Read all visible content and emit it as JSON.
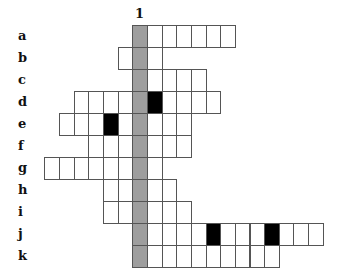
{
  "grid": {
    "col_label": "1",
    "origin_x": 132.3,
    "origin_y": 25,
    "cell_w": 14.65,
    "cell_h": 22,
    "highlight_col": 0,
    "colors": {
      "highlight": "#9e9e9e",
      "black": "#000000",
      "border": "#555555"
    },
    "rows": [
      {
        "label": "a",
        "from": 0,
        "to": 6,
        "black": []
      },
      {
        "label": "b",
        "from": -1,
        "to": 1,
        "black": []
      },
      {
        "label": "c",
        "from": 0,
        "to": 4,
        "black": []
      },
      {
        "label": "d",
        "from": -4,
        "to": 5,
        "black": [
          1
        ]
      },
      {
        "label": "e",
        "from": -5,
        "to": 3,
        "black": [
          -2
        ]
      },
      {
        "label": "f",
        "from": -3,
        "to": 3,
        "black": []
      },
      {
        "label": "g",
        "from": -6,
        "to": 1,
        "black": []
      },
      {
        "label": "h",
        "from": -2,
        "to": 2,
        "black": []
      },
      {
        "label": "i",
        "from": -2,
        "to": 3,
        "black": []
      },
      {
        "label": "j",
        "from": 0,
        "to": 12,
        "black": [
          5,
          9
        ]
      },
      {
        "label": "k",
        "from": 0,
        "to": 9,
        "black": []
      }
    ]
  }
}
